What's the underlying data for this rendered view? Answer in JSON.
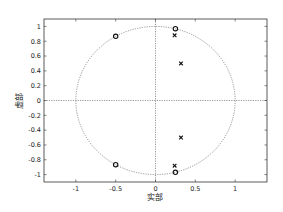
{
  "chart_data": {
    "type": "scatter",
    "title": "",
    "xlabel": "实部",
    "ylabel": "虚部",
    "xlim": [
      -1.4,
      1.4
    ],
    "ylim": [
      -1.1,
      1.1
    ],
    "xticks": [
      -1,
      -0.5,
      0,
      0.5,
      1
    ],
    "xtick_labels": [
      "-1",
      "-0.5",
      "0",
      "0.5",
      "1"
    ],
    "yticks": [
      1,
      0.8,
      0.6,
      0.4,
      0.2,
      0,
      -0.2,
      -0.4,
      -0.6,
      -0.8,
      -1
    ],
    "ytick_labels": [
      "1",
      "0.8",
      "0.6",
      "0.4",
      "0.2",
      "0",
      "-0.2",
      "-0.4",
      "-0.6",
      "-0.8",
      "-1"
    ],
    "grid": false,
    "unit_circle": true,
    "series": [
      {
        "name": "zeros",
        "marker": "o",
        "points": [
          {
            "x": -0.5,
            "y": 0.866
          },
          {
            "x": -0.5,
            "y": -0.866
          },
          {
            "x": 0.25,
            "y": 0.97
          },
          {
            "x": 0.25,
            "y": -0.97
          }
        ]
      },
      {
        "name": "poles",
        "marker": "x",
        "points": [
          {
            "x": 0.24,
            "y": 0.88
          },
          {
            "x": 0.24,
            "y": -0.88
          },
          {
            "x": 0.32,
            "y": 0.5
          },
          {
            "x": 0.32,
            "y": -0.5
          }
        ]
      }
    ]
  },
  "colors": {
    "axes": "#333333",
    "circle": "#555555",
    "markers": "#111111",
    "background": "#ffffff"
  }
}
